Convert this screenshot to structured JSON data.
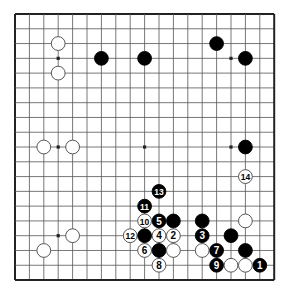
{
  "diagram": {
    "type": "go-board",
    "size": 19,
    "geometry": {
      "origin_x": 15,
      "origin_y": 14,
      "step_x": 14.4,
      "step_y": 14.78,
      "stone_radius": 6.9
    },
    "colors": {
      "line": "#555555",
      "edge": "#222222",
      "black": "#000000",
      "white": "#ffffff",
      "stone_outline": "#444444",
      "background": "#ffffff"
    },
    "star_points": [
      [
        3,
        3
      ],
      [
        9,
        3
      ],
      [
        15,
        3
      ],
      [
        3,
        9
      ],
      [
        9,
        9
      ],
      [
        15,
        9
      ],
      [
        3,
        15
      ],
      [
        9,
        15
      ],
      [
        15,
        15
      ]
    ],
    "stones": [
      {
        "color": "white",
        "col": 3,
        "row": 2,
        "label": ""
      },
      {
        "color": "white",
        "col": 3,
        "row": 4,
        "label": ""
      },
      {
        "color": "black",
        "col": 6,
        "row": 3,
        "label": ""
      },
      {
        "color": "black",
        "col": 9,
        "row": 3,
        "label": ""
      },
      {
        "color": "black",
        "col": 14,
        "row": 2,
        "label": ""
      },
      {
        "color": "black",
        "col": 16,
        "row": 3,
        "label": ""
      },
      {
        "color": "white",
        "col": 2,
        "row": 9,
        "label": ""
      },
      {
        "color": "white",
        "col": 4,
        "row": 9,
        "label": ""
      },
      {
        "color": "black",
        "col": 16,
        "row": 9,
        "label": ""
      },
      {
        "color": "white",
        "col": 4,
        "row": 15,
        "label": ""
      },
      {
        "color": "white",
        "col": 2,
        "row": 16,
        "label": ""
      },
      {
        "color": "black",
        "col": 17,
        "row": 17,
        "label": "1"
      },
      {
        "color": "white",
        "col": 11,
        "row": 15,
        "label": "2"
      },
      {
        "color": "black",
        "col": 13,
        "row": 15,
        "label": "3"
      },
      {
        "color": "white",
        "col": 10,
        "row": 15,
        "label": "4"
      },
      {
        "color": "black",
        "col": 10,
        "row": 14,
        "label": "5"
      },
      {
        "color": "white",
        "col": 9,
        "row": 16,
        "label": "6"
      },
      {
        "color": "black",
        "col": 14,
        "row": 16,
        "label": "7"
      },
      {
        "color": "white",
        "col": 10,
        "row": 17,
        "label": "8"
      },
      {
        "color": "black",
        "col": 14,
        "row": 17,
        "label": "9"
      },
      {
        "color": "white",
        "col": 9,
        "row": 14,
        "label": "10"
      },
      {
        "color": "black",
        "col": 9,
        "row": 13,
        "label": "11"
      },
      {
        "color": "white",
        "col": 8,
        "row": 15,
        "label": "12"
      },
      {
        "color": "black",
        "col": 10,
        "row": 12,
        "label": "13"
      },
      {
        "color": "white",
        "col": 16,
        "row": 11,
        "label": "14"
      },
      {
        "color": "black",
        "col": 11,
        "row": 14,
        "label": ""
      },
      {
        "color": "black",
        "col": 9,
        "row": 15,
        "label": ""
      },
      {
        "color": "black",
        "col": 10,
        "row": 16,
        "label": ""
      },
      {
        "color": "white",
        "col": 11,
        "row": 16,
        "label": ""
      },
      {
        "color": "white",
        "col": 16,
        "row": 14,
        "label": ""
      },
      {
        "color": "black",
        "col": 13,
        "row": 14,
        "label": ""
      },
      {
        "color": "black",
        "col": 15,
        "row": 15,
        "label": ""
      },
      {
        "color": "white",
        "col": 13,
        "row": 16,
        "label": ""
      },
      {
        "color": "black",
        "col": 16,
        "row": 16,
        "label": ""
      },
      {
        "color": "white",
        "col": 15,
        "row": 17,
        "label": ""
      },
      {
        "color": "white",
        "col": 16,
        "row": 17,
        "label": ""
      }
    ]
  }
}
